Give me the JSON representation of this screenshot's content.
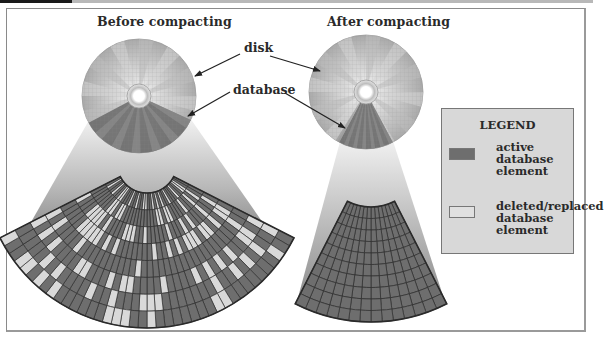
{
  "diagram": {
    "titles": {
      "before": "Before compacting",
      "after": "After compacting"
    },
    "callouts": {
      "disk": "disk",
      "database": "database"
    },
    "legend": {
      "title": "LEGEND",
      "items": [
        {
          "label": "active\ndatabase\nelement",
          "color": "#6e6e6e"
        },
        {
          "label": "deleted/replaced\ndatabase\nelement",
          "color": "#e0e0e0"
        }
      ]
    },
    "colors": {
      "active": "#6e6e6e",
      "deleted": "#d9d9d9",
      "grid_line": "#2e2e2e",
      "disk": "#c4c4c4",
      "funnel_top": "#f0f0f0",
      "funnel_bottom": "#8a8a8a",
      "frame": "#8a8a8a",
      "legend_bg": "#d8d8d8"
    }
  }
}
